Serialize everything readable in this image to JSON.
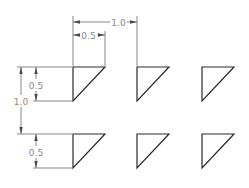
{
  "diagram": {
    "type": "technical-drawing",
    "colors": {
      "geometry": "#2a2a2a",
      "dimension": "#6a6a6a",
      "label": "#8a8a8a",
      "background": "#ffffff"
    },
    "array": {
      "rows": 2,
      "columns": 3,
      "row_spacing": "1.0",
      "column_spacing": "1.0",
      "triangle_width": "0.5",
      "triangle_height": "0.5"
    },
    "dimensions": {
      "horizontal_spacing_label": "1.0",
      "horizontal_width_label": "0.5",
      "vertical_spacing_label": "1.0",
      "vertical_height_top_label": "0.5",
      "vertical_height_bottom_label": "0.5"
    },
    "triangles": [
      {
        "row": 1,
        "col": 1
      },
      {
        "row": 1,
        "col": 2
      },
      {
        "row": 1,
        "col": 3
      },
      {
        "row": 2,
        "col": 1
      },
      {
        "row": 2,
        "col": 2
      },
      {
        "row": 2,
        "col": 3
      }
    ]
  }
}
